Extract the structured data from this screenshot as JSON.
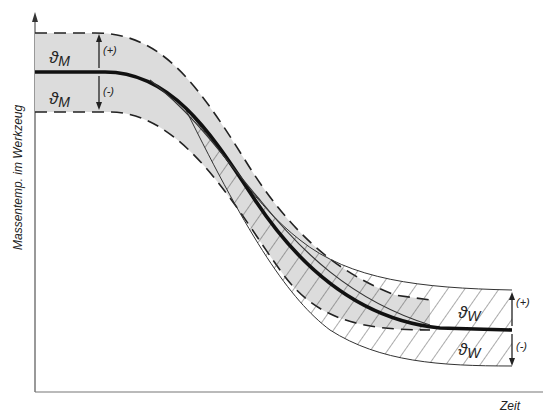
{
  "diagram": {
    "type": "tolerance-band temperature curve",
    "y_axis_label": "Massentemp. im Werkzeug",
    "x_axis_label": "Zeit",
    "band_melt": {
      "symbol": "ϑ",
      "subscript": "M",
      "upper_sign": "(+)",
      "lower_sign": "(-)",
      "style": "grey fill, dashed boundaries"
    },
    "band_wall": {
      "symbol": "ϑ",
      "subscript": "W",
      "upper_sign": "(+)",
      "lower_sign": "(-)",
      "style": "diagonal hatching, thin solid boundaries"
    },
    "colors": {
      "ink": "#1a1a1a",
      "fill": "#d9d9d9",
      "background": "#ffffff"
    }
  }
}
